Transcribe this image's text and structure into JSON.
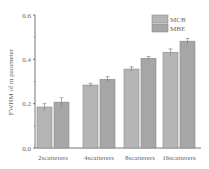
{
  "chart_data": {
    "type": "bar",
    "title": "",
    "xlabel": "",
    "ylabel": "FWHM of m parameter",
    "ylim": [
      0.0,
      0.6
    ],
    "yticks": [
      "0.0",
      "0.2",
      "0.4",
      "0.6"
    ],
    "grid": false,
    "legend_position": "upper-right",
    "categories": [
      "2scatterers",
      "4scatterers",
      "8scatterers",
      "16scatterers"
    ],
    "series": [
      {
        "name": "MCB",
        "color": "#b5b5b5",
        "values": [
          0.185,
          0.284,
          0.356,
          0.432
        ],
        "errors": [
          0.015,
          0.008,
          0.01,
          0.015
        ]
      },
      {
        "name": "MBE",
        "color": "#a6a6a6",
        "values": [
          0.207,
          0.31,
          0.405,
          0.482
        ],
        "errors": [
          0.02,
          0.012,
          0.008,
          0.012
        ]
      }
    ]
  }
}
